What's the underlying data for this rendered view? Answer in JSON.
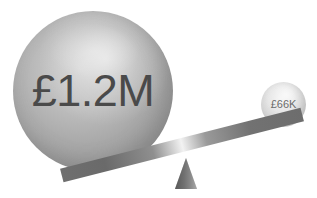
{
  "graphic": {
    "title": "balance-scale-comparison",
    "type": "seesaw-balance-infographic",
    "background_color": "#ffffff",
    "heavy_side": {
      "icon": "large-sphere",
      "label": "£1.2M",
      "value_text": "£1.2M",
      "currency_symbol": "£",
      "amount": "1.2",
      "unit": "M",
      "position": "left",
      "state": "down",
      "color": "#a6a6a6"
    },
    "light_side": {
      "icon": "small-sphere",
      "label": "£66K",
      "value_text": "£66K",
      "currency_symbol": "£",
      "amount": "66",
      "unit": "K",
      "position": "right",
      "state": "up",
      "color": "#dcdcdc"
    },
    "beam": {
      "name": "balance-beam",
      "color": "#6f6f6f",
      "highlight_color": "#f2f2f2",
      "tilt_degrees": "-14.2"
    },
    "fulcrum": {
      "name": "fulcrum-triangle",
      "color": "#7b7b7b"
    }
  },
  "chart_data": {
    "type": "bar",
    "title": "",
    "categories": [
      "£1.2M",
      "£66K"
    ],
    "values": [
      1200000,
      66000
    ],
    "value_labels": [
      "£1.2M",
      "£66K"
    ],
    "xlabel": "",
    "ylabel": "",
    "legend": [],
    "grid": false
  }
}
